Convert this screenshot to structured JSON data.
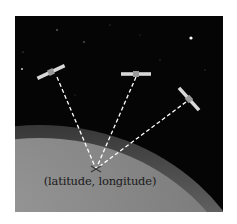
{
  "figure": {
    "caption": "(latitude, longitude)",
    "colors": {
      "space": "#050505",
      "earth": "#8a8a8a",
      "atmosphere": "#a8a8a8",
      "dashed_line": "#ffffff",
      "text": "#1a1a1a"
    },
    "satellites": [
      {
        "name": "satellite-1",
        "cx": 51,
        "cy": 72,
        "angle": -25
      },
      {
        "name": "satellite-2",
        "cx": 136,
        "cy": 74,
        "angle": 0
      },
      {
        "name": "satellite-3",
        "cx": 189,
        "cy": 99,
        "angle": 48
      }
    ],
    "ground_point": {
      "x": 96,
      "y": 169
    }
  }
}
